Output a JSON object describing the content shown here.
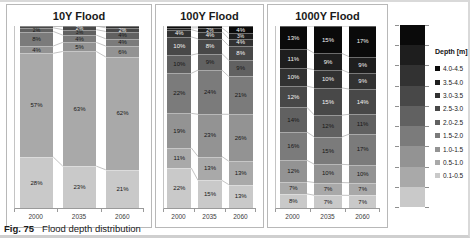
{
  "caption": {
    "label": "Fig. 75",
    "text": "Flood depth distribution"
  },
  "legend": {
    "title": "Depth [m]",
    "items": [
      {
        "label": "4.0-4.5",
        "color": "#0a0a0a"
      },
      {
        "label": "3.5-4.0",
        "color": "#1e1e1e"
      },
      {
        "label": "3.0-3.5",
        "color": "#323232"
      },
      {
        "label": "2.5-3.0",
        "color": "#484848"
      },
      {
        "label": "2.0-2.5",
        "color": "#616161"
      },
      {
        "label": "1.5-2.0",
        "color": "#7b7b7b"
      },
      {
        "label": "1.0-1.5",
        "color": "#939393"
      },
      {
        "label": "0.5-1.0",
        "color": "#a9a9a9"
      },
      {
        "label": "0.1-0.5",
        "color": "#c9c9c9"
      }
    ]
  },
  "chart_data": [
    {
      "type": "bar",
      "stacked": true,
      "title": "10Y Flood",
      "categories": [
        "2000",
        "2035",
        "2060"
      ],
      "ylim": [
        0,
        100
      ],
      "unit": "%",
      "series": [
        {
          "name": "0.1-0.5",
          "color": "#c9c9c9",
          "values": [
            28,
            23,
            21
          ]
        },
        {
          "name": "0.5-1.0",
          "color": "#a9a9a9",
          "values": [
            57,
            63,
            62
          ]
        },
        {
          "name": "1.0-1.5",
          "color": "#939393",
          "values": [
            4,
            5,
            6
          ]
        },
        {
          "name": "1.5-2.0",
          "color": "#7b7b7b",
          "values": [
            8,
            4,
            4
          ]
        },
        {
          "name": "2.0-2.5",
          "color": "#616161",
          "values": [
            2,
            3,
            4
          ]
        },
        {
          "name": "2.5-3.0",
          "color": "#484848",
          "values": [
            1,
            2,
            2
          ]
        },
        {
          "name": "3.0-3.5",
          "color": "#323232",
          "values": [
            0,
            0,
            1
          ]
        },
        {
          "name": "3.5-4.0",
          "color": "#1e1e1e",
          "values": [
            0,
            0,
            0
          ]
        },
        {
          "name": "4.0-4.5",
          "color": "#0a0a0a",
          "values": [
            0,
            0,
            0
          ]
        }
      ]
    },
    {
      "type": "bar",
      "stacked": true,
      "title": "100Y Flood",
      "categories": [
        "2000",
        "2035",
        "2060"
      ],
      "ylim": [
        0,
        100
      ],
      "unit": "%",
      "series": [
        {
          "name": "0.1-0.5",
          "color": "#c9c9c9",
          "values": [
            22,
            15,
            13
          ]
        },
        {
          "name": "0.5-1.0",
          "color": "#a9a9a9",
          "values": [
            11,
            13,
            13
          ]
        },
        {
          "name": "1.0-1.5",
          "color": "#939393",
          "values": [
            19,
            23,
            26
          ]
        },
        {
          "name": "1.5-2.0",
          "color": "#7b7b7b",
          "values": [
            22,
            24,
            21
          ]
        },
        {
          "name": "2.0-2.5",
          "color": "#616161",
          "values": [
            10,
            9,
            9
          ]
        },
        {
          "name": "2.5-3.0",
          "color": "#484848",
          "values": [
            10,
            8,
            8
          ]
        },
        {
          "name": "3.0-3.5",
          "color": "#323232",
          "values": [
            4,
            4,
            4
          ]
        },
        {
          "name": "3.5-4.0",
          "color": "#1e1e1e",
          "values": [
            1,
            2,
            3
          ]
        },
        {
          "name": "4.0-4.5",
          "color": "#0a0a0a",
          "values": [
            1,
            1,
            4
          ]
        }
      ]
    },
    {
      "type": "bar",
      "stacked": true,
      "title": "1000Y Flood",
      "categories": [
        "2000",
        "2035",
        "2060"
      ],
      "ylim": [
        0,
        100
      ],
      "unit": "%",
      "series": [
        {
          "name": "0.1-0.5",
          "color": "#c9c9c9",
          "values": [
            8,
            7,
            7
          ]
        },
        {
          "name": "0.5-1.0",
          "color": "#a9a9a9",
          "values": [
            7,
            7,
            7
          ]
        },
        {
          "name": "1.0-1.5",
          "color": "#939393",
          "values": [
            12,
            10,
            10
          ]
        },
        {
          "name": "1.5-2.0",
          "color": "#7b7b7b",
          "values": [
            16,
            15,
            17
          ]
        },
        {
          "name": "2.0-2.5",
          "color": "#616161",
          "values": [
            14,
            12,
            11
          ]
        },
        {
          "name": "2.5-3.0",
          "color": "#484848",
          "values": [
            12,
            15,
            14
          ]
        },
        {
          "name": "3.0-3.5",
          "color": "#323232",
          "values": [
            10,
            10,
            9
          ]
        },
        {
          "name": "3.5-4.0",
          "color": "#1e1e1e",
          "values": [
            11,
            9,
            9
          ]
        },
        {
          "name": "4.0-4.5",
          "color": "#0a0a0a",
          "values": [
            13,
            15,
            17
          ]
        }
      ]
    }
  ]
}
